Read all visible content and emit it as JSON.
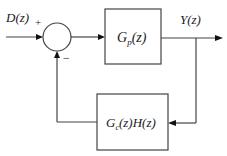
{
  "diagram": {
    "type": "feedback-control-block-diagram",
    "input": {
      "label": "D(z)"
    },
    "output": {
      "label": "Y(z)"
    },
    "summing_junction": {
      "signs": {
        "top": "+",
        "bottom": "−"
      }
    },
    "forward_block": {
      "label_main": "G",
      "label_sub": "p",
      "label_rest": "(z)"
    },
    "feedback_block": {
      "label_main": "G",
      "label_sub": "c",
      "label_rest": "(z)H(z)"
    },
    "colors": {
      "line": "#444444",
      "text": "#1a1a1a",
      "background": "#ffffff"
    }
  }
}
